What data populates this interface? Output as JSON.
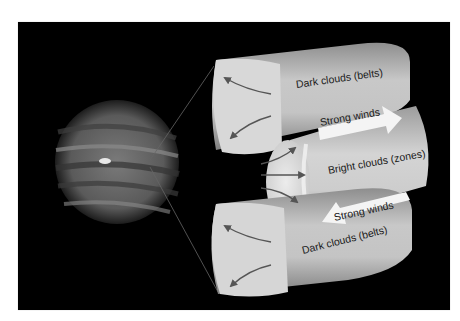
{
  "diagram": {
    "colors": {
      "background": "#ffffff",
      "panel": "#000000",
      "cloud_light": "#e6e6e6",
      "cloud_mid": "#b4b4b4",
      "arrow_dark": "#555555",
      "wind_arrow": "#f4f4f4",
      "text": "#1a1a1a"
    },
    "labels": {
      "top_belt": "Dark clouds (belts)",
      "top_wind": "Strong winds",
      "zone": "Bright clouds (zones)",
      "bottom_wind": "Strong winds",
      "bottom_belt": "Dark clouds (belts)"
    },
    "wind_arrows": [
      {
        "label": "Strong winds",
        "direction": "east"
      },
      {
        "label": "Strong winds",
        "direction": "west"
      }
    ],
    "flow_arrows": {
      "upper_belt": [
        "up-left",
        "down-left"
      ],
      "zone": [
        "up-right",
        "right",
        "down-right"
      ],
      "lower_belt": [
        "up-left",
        "down-left"
      ]
    }
  }
}
